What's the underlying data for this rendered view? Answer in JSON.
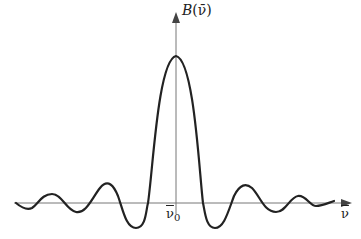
{
  "figure": {
    "y_axis_label_func": "B",
    "y_axis_label_arg": "(ν̄)",
    "x_axis_label": "ν",
    "x_center_label": "ν",
    "x_center_subscript": "0",
    "curve_color": "#222222",
    "axis_color": "#777777"
  },
  "curve": {
    "description": "sinc-squared-like interferogram line shape, symmetric about ν̄0",
    "center_px": [
      176,
      203
    ],
    "peak_px": [
      176,
      56
    ],
    "zero_crossings_px_x": [
      148,
      203
    ],
    "side_lobes": "damped oscillation on both sides"
  }
}
